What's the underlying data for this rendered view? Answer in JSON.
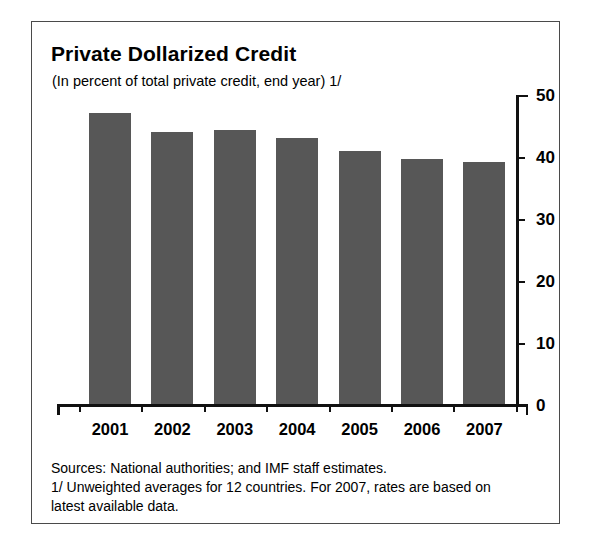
{
  "figure": {
    "title": "Private Dollarized Credit",
    "subtitle": "(In percent of total private credit, end year) 1/",
    "source_note": "Sources: National authorities; and IMF staff estimates.",
    "footnote": "1/ Unweighted averages for 12 countries. For 2007, rates are based on latest available data.",
    "bar_color": "#575757",
    "axis_color": "#111111",
    "frame_color": "#4a4a4a"
  },
  "chart_data": {
    "type": "bar",
    "title": "Private Dollarized Credit",
    "subtitle": "(In percent of total private credit, end year) 1/",
    "xlabel": "",
    "ylabel": "",
    "categories": [
      "2001",
      "2002",
      "2003",
      "2004",
      "2005",
      "2006",
      "2007"
    ],
    "values": [
      47.2,
      44.2,
      44.5,
      43.2,
      41.2,
      39.9,
      39.4
    ],
    "ylim": [
      0,
      50
    ],
    "yticks": [
      0,
      10,
      20,
      30,
      40,
      50
    ],
    "ytick_labels": [
      "0",
      "10",
      "20",
      "30",
      "40",
      "50"
    ],
    "y_axis_position": "right",
    "grid": false,
    "legend": null
  }
}
